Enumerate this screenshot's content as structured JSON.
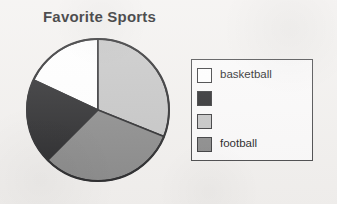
{
  "chart_data": {
    "type": "pie",
    "title": "Favorite Sports",
    "xlabel": "",
    "ylabel": "",
    "legend_position": "right",
    "grid": false,
    "categories": [
      "basketball",
      "",
      "",
      "football"
    ],
    "values": [
      18,
      19,
      31,
      32
    ],
    "slices": [
      {
        "label": "basketball",
        "color": "#ffffff",
        "start_angle_deg": 295,
        "end_angle_deg": 360,
        "percent": 18
      },
      {
        "label": "",
        "color": "#2a2a2c",
        "start_angle_deg": 225,
        "end_angle_deg": 295,
        "percent": 19
      },
      {
        "label": "",
        "color": "#c6c6c6",
        "start_angle_deg": 0,
        "end_angle_deg": 112,
        "percent": 31
      },
      {
        "label": "football",
        "color": "#8b8b8b",
        "start_angle_deg": 112,
        "end_angle_deg": 225,
        "percent": 32
      }
    ],
    "legend_entries": [
      {
        "label": "basketball",
        "color": "#ffffff"
      },
      {
        "label": "",
        "color": "#2a2a2c"
      },
      {
        "label": "",
        "color": "#c6c6c6"
      },
      {
        "label": "football",
        "color": "#8b8b8b"
      }
    ]
  },
  "colors": {
    "outline": "#2b2b2d",
    "legend_border": "#4a4a4c",
    "background": "#f3f1ef",
    "title_text": "#18181a"
  }
}
